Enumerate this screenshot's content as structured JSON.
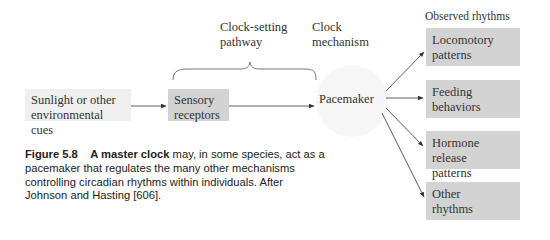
{
  "diagram": {
    "labels": {
      "clock_setting_pathway": [
        "Clock-setting",
        "pathway"
      ],
      "clock_mechanism": [
        "Clock",
        "mechanism"
      ],
      "observed_rhythms": "Observed rhythms"
    },
    "nodes": {
      "environment": [
        "Sunlight or other",
        "environmental cues"
      ],
      "sensory": [
        "Sensory",
        "receptors"
      ],
      "pacemaker": "Pacemaker",
      "outputs": [
        {
          "lines": [
            "Locomotory",
            "patterns"
          ]
        },
        {
          "lines": [
            "Feeding",
            "behaviors"
          ]
        },
        {
          "lines": [
            "Hormone release",
            "patterns"
          ]
        },
        {
          "lines": [
            "Other",
            "rhythms"
          ]
        }
      ]
    },
    "colors": {
      "environment_box": "#efefef",
      "receptor_box": "#d3d3d3",
      "output_box": "#d3d3d3",
      "pacemaker_fill": "#f6f6f6",
      "arrow": "#333333"
    }
  },
  "caption": {
    "figure_label": "Figure 5.8",
    "lead": "A master clock",
    "text": " may, in some species, act as a pacemaker that regulates the many other mechanisms controlling circadian rhythms within individuals. After Johnson and Hasting [606]."
  }
}
